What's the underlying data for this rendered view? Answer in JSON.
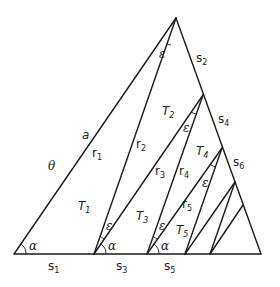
{
  "diagram": {
    "type": "nested-triangle-subdivision",
    "outer_triangle": {
      "left": "bottom-left",
      "apex": "top",
      "right": "bottom-right"
    },
    "labels": {
      "a": "a",
      "theta": "θ",
      "r1": {
        "base": "r",
        "sub": "1"
      },
      "r2": {
        "base": "r",
        "sub": "2"
      },
      "r3": {
        "base": "r",
        "sub": "3"
      },
      "r4": {
        "base": "r",
        "sub": "4"
      },
      "r5": {
        "base": "r",
        "sub": "5"
      },
      "T1": {
        "base": "T",
        "sub": "1"
      },
      "T2": {
        "base": "T",
        "sub": "2"
      },
      "T3": {
        "base": "T",
        "sub": "3"
      },
      "T4": {
        "base": "T",
        "sub": "4"
      },
      "T5": {
        "base": "T",
        "sub": "5"
      },
      "s1": {
        "base": "s",
        "sub": "1"
      },
      "s2": {
        "base": "s",
        "sub": "2"
      },
      "s3": {
        "base": "s",
        "sub": "3"
      },
      "s4": {
        "base": "s",
        "sub": "4"
      },
      "s5": {
        "base": "s",
        "sub": "5"
      },
      "s6": {
        "base": "s",
        "sub": "6"
      },
      "alpha": "α",
      "epsilon": "ε"
    }
  }
}
